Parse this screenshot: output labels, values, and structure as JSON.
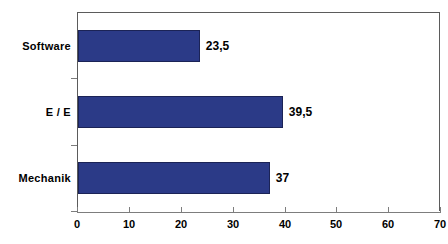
{
  "chart_data": {
    "type": "bar",
    "orientation": "horizontal",
    "title": "",
    "subtitle": "",
    "xlabel": "",
    "ylabel": "",
    "categories": [
      "Mechanik",
      "E / E",
      "Software"
    ],
    "values": [
      37,
      39.5,
      23.5
    ],
    "value_labels": [
      "37",
      "39,5",
      "23,5"
    ],
    "series": [
      {
        "name": "",
        "values": [
          37,
          39.5,
          23.5
        ],
        "color": "#2b3a87"
      }
    ],
    "xlim": [
      0,
      70
    ],
    "xticks": [
      0,
      10,
      20,
      30,
      40,
      50,
      60,
      70
    ],
    "xtick_labels": [
      "0",
      "10",
      "20",
      "30",
      "40",
      "50",
      "60",
      "70"
    ],
    "grid": false,
    "legend": false,
    "legend_position": "none",
    "bar_color": "#2b3a87",
    "bar_border_color": "#1b2356",
    "axis_color": "#5b5b5b",
    "background": "#ffffff",
    "decimal_separator": ","
  },
  "axis": {
    "tick_0": "0",
    "tick_10": "10",
    "tick_20": "20",
    "tick_30": "30",
    "tick_40": "40",
    "tick_50": "50",
    "tick_60": "60",
    "tick_70": "70"
  },
  "categories": {
    "software": "Software",
    "ee": "E / E",
    "mechanik": "Mechanik"
  },
  "values": {
    "software": "23,5",
    "ee": "39,5",
    "mechanik": "37"
  }
}
